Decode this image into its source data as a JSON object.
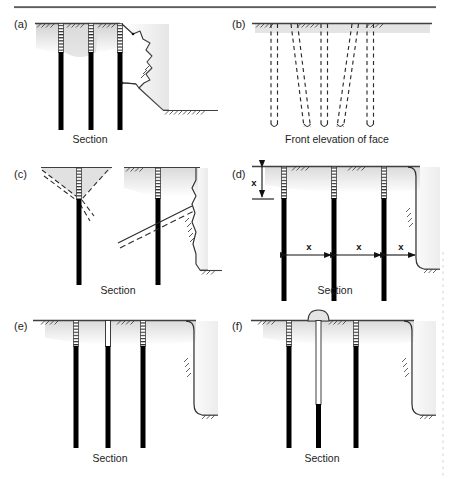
{
  "figure": {
    "title_rule": "top-horizontal-rule",
    "background": "#ffffff",
    "colors": {
      "ink": "#1d1d1d",
      "pile_fill": "#000000",
      "ground_line": "#4a4a4a",
      "shade": "#d8d8d8",
      "soft_shadow": "#c9c9c9",
      "margin_mark": "#b9b9b9"
    },
    "panels": [
      {
        "id": "a",
        "label": "(a)",
        "caption": "Section",
        "description": "Contiguous bored pile wall with irregular over-break rock face behind the exposed pile line",
        "pile_count": 3
      },
      {
        "id": "b",
        "label": "(b)",
        "caption": "Front elevation of face",
        "description": "Front elevation showing dashed pile outlines, two of which are raked out of vertical alignment",
        "pile_count": 5
      },
      {
        "id": "c",
        "label": "(c)",
        "caption": "Section",
        "description": "Two sections showing a shaded V-shaped ground loss wedge at pile head and an inclined slip plane behind the exposed face",
        "pile_count": 2
      },
      {
        "id": "d",
        "label": "(d)",
        "caption": "Section",
        "description": "Section with vertical dimension x at pile head and three horizontal pile spacings x",
        "pile_count": 3,
        "dimensions": {
          "vertical": "x",
          "horizontal": [
            "x",
            "x",
            "x"
          ]
        }
      },
      {
        "id": "e",
        "label": "(e)",
        "caption": "Section",
        "description": "Section where the central pile is an open hollow tube at the head with no reinforcement cage hatching",
        "pile_count": 3
      },
      {
        "id": "f",
        "label": "(f)",
        "caption": "Section",
        "description": "Section where the central pile overflows at ground level forming a domed concrete mushroom cap",
        "pile_count": 3
      }
    ],
    "dimension_labels": {
      "vertical_x": "x",
      "spacing_x_1": "x",
      "spacing_x_2": "x",
      "spacing_x_3": "x"
    },
    "captions": {
      "section": "Section",
      "front_elevation": "Front elevation of face"
    }
  }
}
